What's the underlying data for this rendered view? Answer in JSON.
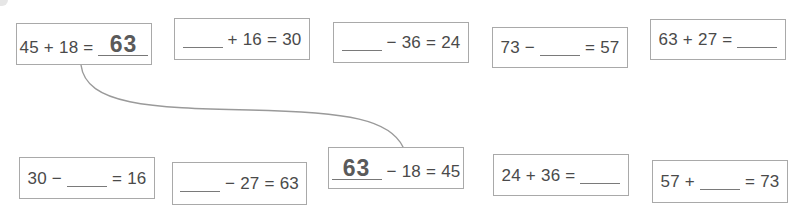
{
  "worksheet": {
    "top_row": [
      {
        "id": "t1",
        "parts": [
          "45",
          "+",
          "18",
          "="
        ],
        "blank_position": 4,
        "answer": "63",
        "filled": true,
        "box": {
          "x": 16,
          "y": 23,
          "w": 136,
          "h": 42
        }
      },
      {
        "id": "t2",
        "parts": [
          "+",
          "16",
          "=",
          "30"
        ],
        "blank_position": 0,
        "answer": "",
        "filled": false,
        "box": {
          "x": 174,
          "y": 18,
          "w": 136,
          "h": 42
        }
      },
      {
        "id": "t3",
        "parts": [
          "−",
          "36",
          "=",
          "24"
        ],
        "blank_position": 0,
        "answer": "",
        "filled": false,
        "box": {
          "x": 333,
          "y": 22,
          "w": 136,
          "h": 41
        }
      },
      {
        "id": "t4",
        "parts": [
          "73",
          "−",
          "=",
          "57"
        ],
        "blank_position": 2,
        "answer": "",
        "filled": false,
        "box": {
          "x": 492,
          "y": 27,
          "w": 136,
          "h": 41
        }
      },
      {
        "id": "t5",
        "parts": [
          "63",
          "+",
          "27",
          "="
        ],
        "blank_position": 4,
        "answer": "",
        "filled": false,
        "box": {
          "x": 650,
          "y": 19,
          "w": 136,
          "h": 41
        }
      }
    ],
    "bottom_row": [
      {
        "id": "b1",
        "parts": [
          "30",
          "−",
          "=",
          "16"
        ],
        "blank_position": 2,
        "answer": "",
        "filled": false,
        "box": {
          "x": 19,
          "y": 157,
          "w": 136,
          "h": 42
        }
      },
      {
        "id": "b2",
        "parts": [
          "−",
          "27",
          "=",
          "63"
        ],
        "blank_position": 0,
        "answer": "",
        "filled": false,
        "box": {
          "x": 172,
          "y": 162,
          "w": 135,
          "h": 43
        }
      },
      {
        "id": "b3",
        "parts": [
          "−",
          "18",
          "=",
          "45"
        ],
        "blank_position": 0,
        "answer": "63",
        "filled": true,
        "box": {
          "x": 328,
          "y": 147,
          "w": 136,
          "h": 42
        }
      },
      {
        "id": "b4",
        "parts": [
          "24",
          "+",
          "36",
          "="
        ],
        "blank_position": 4,
        "answer": "",
        "filled": false,
        "box": {
          "x": 493,
          "y": 154,
          "w": 136,
          "h": 42
        }
      },
      {
        "id": "b5",
        "parts": [
          "57",
          "+",
          "=",
          "73"
        ],
        "blank_position": 2,
        "answer": "",
        "filled": false,
        "box": {
          "x": 652,
          "y": 160,
          "w": 136,
          "h": 43
        }
      }
    ],
    "connectors": [
      {
        "from": "t1",
        "to": "b3",
        "path": "M81,65 C86,105 150,108 250,110 C350,112 390,120 403,147"
      }
    ],
    "colors": {
      "box_border": "#a9a9a9",
      "text": "#4a4a4a",
      "answer": "#5a5a5a",
      "connector": "#9a9a9a",
      "background": "#ffffff"
    }
  }
}
